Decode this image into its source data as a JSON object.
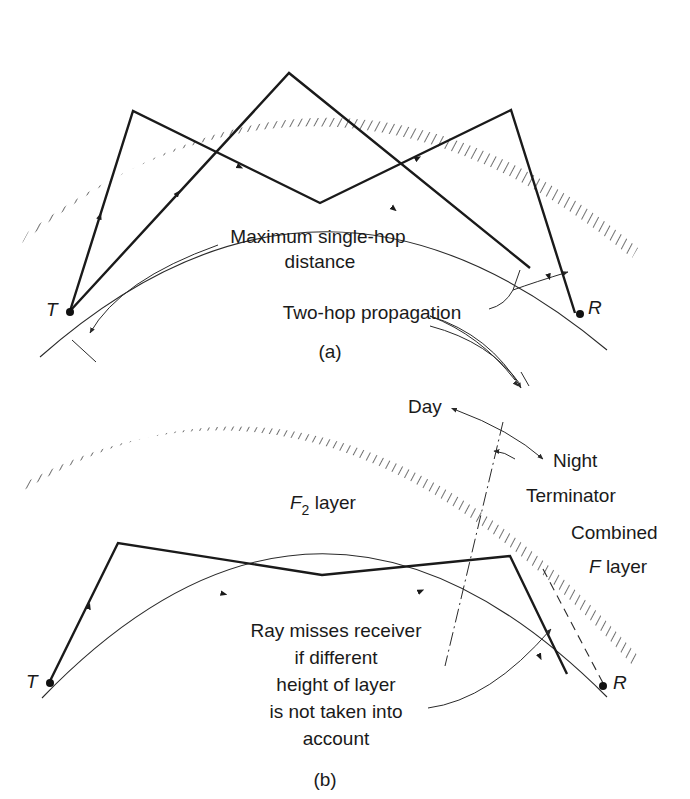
{
  "figure": {
    "panel_a": {
      "caption": "(a)",
      "transmitter_label": "T",
      "receiver_label": "R",
      "max_hop_label_line1": "Maximum single-hop",
      "max_hop_label_line2": "distance",
      "two_hop_label": "Two-hop propagation"
    },
    "panel_b": {
      "caption": "(b)",
      "transmitter_label": "T",
      "receiver_label": "R",
      "f2_layer_label_main": "F",
      "f2_layer_label_sub": "2",
      "f2_layer_label_rest": " layer",
      "day_label": "Day",
      "night_label": "Night",
      "terminator_label": "Terminator",
      "combined_label_line1": "Combined",
      "combined_label_f": "F",
      "combined_label_rest": " layer",
      "note_lines": [
        "Ray misses receiver",
        "if different",
        "height of layer",
        "is not taken into",
        "account"
      ]
    }
  }
}
